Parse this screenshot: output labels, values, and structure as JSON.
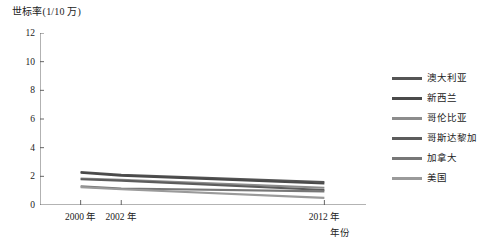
{
  "chart_data": {
    "type": "line",
    "title": "",
    "ylabel": "世标率(1/10 万)",
    "xlabel": "年份",
    "ylim": [
      0,
      12
    ],
    "yticks": [
      0,
      2,
      4,
      6,
      8,
      10,
      12
    ],
    "ytick_labels": [
      "0",
      "2",
      "4",
      "6",
      "8",
      "10",
      "12"
    ],
    "xlim": [
      1998,
      2014
    ],
    "xticks": [
      2000,
      2002,
      2012
    ],
    "xtick_labels": [
      "2000 年",
      "2002 年",
      "2012 年"
    ],
    "grid": false,
    "legend_position": "right",
    "x": [
      2000,
      2002,
      2012
    ],
    "series": [
      {
        "name": "澳大利亚",
        "color": "#555555",
        "values": [
          2.3,
          2.1,
          1.6
        ]
      },
      {
        "name": "新西兰",
        "color": "#4a4a4a",
        "values": [
          2.25,
          2.05,
          1.5
        ]
      },
      {
        "name": "哥伦比亚",
        "color": "#8c8c8c",
        "values": [
          1.85,
          1.75,
          1.2
        ]
      },
      {
        "name": "哥斯达黎加",
        "color": "#5c5c5c",
        "values": [
          1.8,
          1.7,
          1.05
        ]
      },
      {
        "name": "加拿大",
        "color": "#777777",
        "values": [
          1.3,
          1.15,
          0.95
        ]
      },
      {
        "name": "美国",
        "color": "#9a9a9a",
        "values": [
          1.25,
          1.1,
          0.5
        ]
      }
    ]
  },
  "axes": {
    "y_axis_title": "世标率(1/10 万)",
    "x_axis_title": "年份"
  },
  "legend": {
    "items": [
      {
        "label": "澳大利亚"
      },
      {
        "label": "新西兰"
      },
      {
        "label": "哥伦比亚"
      },
      {
        "label": "哥斯达黎加"
      },
      {
        "label": "加拿大"
      },
      {
        "label": "美国"
      }
    ]
  }
}
